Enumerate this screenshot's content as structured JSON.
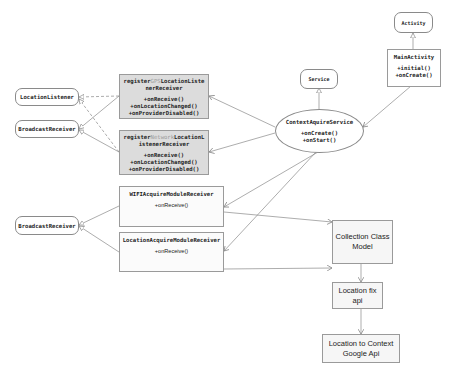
{
  "diagram": {
    "type": "uml-class-diagram",
    "nodes": {
      "location_listener": {
        "label": "LocationListener"
      },
      "broadcast_receiver_top": {
        "label": "BroadcastReceiver"
      },
      "broadcast_receiver_bottom": {
        "label": "BroadcastReceiver"
      },
      "gps_receiver": {
        "title_prefix": "register",
        "title_faded": "GPS",
        "title_suffix": "LocationListe",
        "title_line2": "nerReceiver",
        "methods": [
          "+onReceive()",
          "+onLocationChanged()",
          "+onProviderDisabled()"
        ]
      },
      "network_receiver": {
        "title_prefix": "register",
        "title_faded": "Network",
        "title_suffix": "LocationL",
        "title_line2": "istenerReceiver",
        "methods": [
          "+onReceive()",
          "+onLocationChanged()",
          "+onProviderDisabled()"
        ]
      },
      "wifi_receiver": {
        "title": "WIFIAcquireModuleReceiver",
        "methods": [
          "+onReceive()"
        ]
      },
      "location_acquire_receiver": {
        "title": "LocationAcquireModuleReceiver",
        "methods": [
          "+onReceive()"
        ]
      },
      "service": {
        "label": "Service"
      },
      "context_aquire_service": {
        "title": "ContextAquireService",
        "methods": [
          "+onCreate()",
          "+onStart()"
        ]
      },
      "activity": {
        "label": "Activity"
      },
      "main_activity": {
        "title": "MainActivity",
        "methods": [
          "+initial()",
          "+onCreate()"
        ]
      },
      "collection_class_model": {
        "line1": "Collection Class",
        "line2": "Model"
      },
      "location_fix_api": {
        "line1": "Location fix",
        "line2": "api"
      },
      "location_to_context": {
        "line1": "Location to Context",
        "line2": "Google Api"
      }
    },
    "edges": [
      {
        "from": "gps_receiver",
        "to": "location_listener",
        "style": "dashed",
        "kind": "realization"
      },
      {
        "from": "network_receiver",
        "to": "location_listener",
        "style": "dashed",
        "kind": "realization"
      },
      {
        "from": "gps_receiver",
        "to": "broadcast_receiver_top",
        "style": "solid",
        "kind": "inheritance"
      },
      {
        "from": "network_receiver",
        "to": "broadcast_receiver_top",
        "style": "solid",
        "kind": "inheritance"
      },
      {
        "from": "wifi_receiver",
        "to": "broadcast_receiver_bottom",
        "style": "solid",
        "kind": "inheritance"
      },
      {
        "from": "location_acquire_receiver",
        "to": "broadcast_receiver_bottom",
        "style": "solid",
        "kind": "inheritance"
      },
      {
        "from": "context_aquire_service",
        "to": "service",
        "style": "solid",
        "kind": "inheritance"
      },
      {
        "from": "main_activity",
        "to": "activity",
        "style": "solid",
        "kind": "inheritance"
      },
      {
        "from": "main_activity",
        "to": "context_aquire_service",
        "style": "solid",
        "kind": "association"
      },
      {
        "from": "context_aquire_service",
        "to": "gps_receiver",
        "style": "solid",
        "kind": "association"
      },
      {
        "from": "context_aquire_service",
        "to": "network_receiver",
        "style": "solid",
        "kind": "association"
      },
      {
        "from": "context_aquire_service",
        "to": "wifi_receiver",
        "style": "solid",
        "kind": "association"
      },
      {
        "from": "context_aquire_service",
        "to": "location_acquire_receiver",
        "style": "solid",
        "kind": "association"
      },
      {
        "from": "wifi_receiver",
        "to": "collection_class_model",
        "style": "solid",
        "kind": "association"
      },
      {
        "from": "location_acquire_receiver",
        "to": "collection_class_model",
        "style": "solid",
        "kind": "association"
      },
      {
        "from": "collection_class_model",
        "to": "location_fix_api",
        "style": "solid",
        "kind": "association"
      },
      {
        "from": "location_fix_api",
        "to": "location_to_context",
        "style": "solid",
        "kind": "association"
      }
    ],
    "colors": {
      "line": "#8a8a8a",
      "receiver_fill": "#dcdcdc",
      "box_fill": "#f6f6f6",
      "faded_text": "#9a9a9a"
    }
  }
}
